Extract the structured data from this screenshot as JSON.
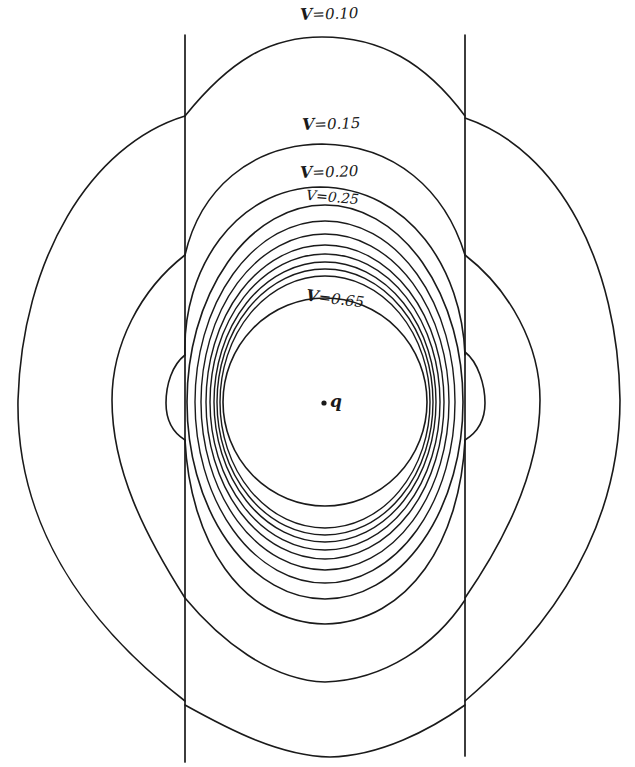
{
  "figure": {
    "charge_label": "q",
    "boundary_lines": [
      {
        "x": 185,
        "y1": 35,
        "y2": 762
      },
      {
        "x": 465,
        "y1": 35,
        "y2": 756
      }
    ],
    "contour_labels": [
      {
        "text": "V=0.10",
        "var": "V",
        "value": "=0.10",
        "x": 300,
        "y": 6,
        "rot": -2
      },
      {
        "text": "V=0.15",
        "var": "V",
        "value": "=0.15",
        "x": 302,
        "y": 115,
        "rot": -2
      },
      {
        "text": "V=0.20",
        "var": "V",
        "value": "=0.20",
        "x": 300,
        "y": 166,
        "rot": -2
      },
      {
        "text": "V=0.25",
        "var": "V",
        "value": "=0.25",
        "x": 306,
        "y": 190,
        "rot": 6
      },
      {
        "text": "V=0.65",
        "var": "V",
        "value": "=0.65",
        "x": 306,
        "y": 288,
        "rot": 8
      }
    ],
    "contour_values": [
      0.1,
      0.15,
      0.2,
      0.25,
      0.3,
      0.35,
      0.4,
      0.45,
      0.5,
      0.55,
      0.6,
      0.65
    ]
  }
}
